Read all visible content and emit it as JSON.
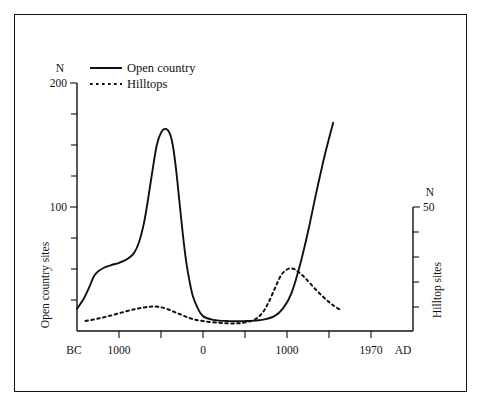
{
  "chart_data": {
    "type": "line",
    "title": "",
    "subtitle": "",
    "xlabel_left": "BC",
    "xlabel_right": "AD",
    "x_tick_labels": [
      "BC",
      "1000",
      "0",
      "1000",
      "1970",
      "AD"
    ],
    "x_major_ticks": [
      "1000",
      "0",
      "1000",
      "1970"
    ],
    "x_axis_range_years": [
      -2000,
      1970
    ],
    "grid": false,
    "legend_position": "top-left",
    "left_axis": {
      "unit_label": "N",
      "title": "Open country sites",
      "ylim": [
        0,
        200
      ],
      "tick_labels": [
        "200",
        "100"
      ],
      "tick_step": 25,
      "tick_values": [
        0,
        25,
        50,
        75,
        100,
        125,
        150,
        175,
        200
      ]
    },
    "right_axis": {
      "unit_label": "N",
      "title": "Hilltop sites",
      "ylim": [
        0,
        50
      ],
      "tick_labels": [
        "50"
      ],
      "tick_step": 10,
      "tick_values": [
        0,
        10,
        20,
        30,
        40,
        50
      ]
    },
    "series": [
      {
        "name": "Open country",
        "style": "solid",
        "axis": "left",
        "points": [
          [
            -2000,
            6
          ],
          [
            -1850,
            8
          ],
          [
            -1700,
            10
          ],
          [
            -1600,
            13
          ],
          [
            -1500,
            18
          ],
          [
            -1420,
            26
          ],
          [
            -1350,
            36
          ],
          [
            -1300,
            44
          ],
          [
            -1250,
            48
          ],
          [
            -1180,
            51
          ],
          [
            -1100,
            53
          ],
          [
            -1000,
            55
          ],
          [
            -900,
            58
          ],
          [
            -820,
            63
          ],
          [
            -760,
            72
          ],
          [
            -700,
            88
          ],
          [
            -650,
            108
          ],
          [
            -600,
            130
          ],
          [
            -550,
            150
          ],
          [
            -500,
            160
          ],
          [
            -450,
            163
          ],
          [
            -400,
            160
          ],
          [
            -360,
            150
          ],
          [
            -320,
            130
          ],
          [
            -280,
            104
          ],
          [
            -240,
            78
          ],
          [
            -200,
            56
          ],
          [
            -160,
            40
          ],
          [
            -120,
            28
          ],
          [
            -60,
            18
          ],
          [
            0,
            12
          ],
          [
            120,
            9
          ],
          [
            300,
            8
          ],
          [
            500,
            8
          ],
          [
            700,
            9
          ],
          [
            850,
            12
          ],
          [
            950,
            18
          ],
          [
            1050,
            30
          ],
          [
            1150,
            52
          ],
          [
            1250,
            80
          ],
          [
            1350,
            112
          ],
          [
            1450,
            142
          ],
          [
            1550,
            168
          ]
        ]
      },
      {
        "name": "Hilltops",
        "style": "dashed",
        "axis": "right",
        "points": [
          [
            -2000,
            1.5
          ],
          [
            -1850,
            2.0
          ],
          [
            -1700,
            2.6
          ],
          [
            -1550,
            3.2
          ],
          [
            -1400,
            4.0
          ],
          [
            -1250,
            5.0
          ],
          [
            -1100,
            6.2
          ],
          [
            -950,
            7.6
          ],
          [
            -800,
            8.9
          ],
          [
            -680,
            9.6
          ],
          [
            -600,
            9.9
          ],
          [
            -520,
            9.7
          ],
          [
            -420,
            8.8
          ],
          [
            -320,
            7.4
          ],
          [
            -220,
            6.0
          ],
          [
            -120,
            4.8
          ],
          [
            0,
            4.0
          ],
          [
            150,
            3.4
          ],
          [
            300,
            3.1
          ],
          [
            450,
            3.2
          ],
          [
            600,
            4.4
          ],
          [
            700,
            7.0
          ],
          [
            780,
            11.5
          ],
          [
            860,
            17.5
          ],
          [
            930,
            22.5
          ],
          [
            1000,
            24.8
          ],
          [
            1060,
            25.2
          ],
          [
            1130,
            24.0
          ],
          [
            1220,
            21.2
          ],
          [
            1320,
            17.5
          ],
          [
            1430,
            13.8
          ],
          [
            1540,
            10.6
          ],
          [
            1650,
            8.2
          ]
        ]
      }
    ],
    "legend": [
      {
        "label": "Open country",
        "style": "solid"
      },
      {
        "label": "Hilltops",
        "style": "dashed"
      }
    ]
  }
}
